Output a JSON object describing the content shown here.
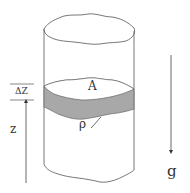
{
  "diagram": {
    "labels": {
      "area": "A",
      "density": "ρ",
      "thickness": "ΔZ",
      "height": "z",
      "gravity": "g"
    },
    "colors": {
      "stroke": "#555555",
      "slab_fill": "#a8a8a8",
      "background": "#ffffff"
    }
  }
}
